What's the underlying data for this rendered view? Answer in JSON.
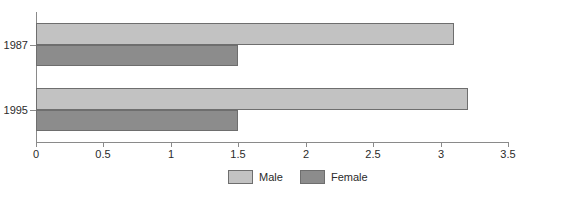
{
  "chart_data": {
    "type": "bar",
    "orientation": "horizontal",
    "title": "",
    "xlabel": "",
    "ylabel": "",
    "categories": [
      "1987",
      "1995"
    ],
    "series": [
      {
        "name": "Male",
        "color": "#c2c2c2",
        "values": [
          3.1,
          3.2
        ]
      },
      {
        "name": "Female",
        "color": "#8c8c8c",
        "values": [
          1.5,
          1.5
        ]
      }
    ],
    "xlim": [
      0,
      3.5
    ],
    "xticks": [
      0,
      0.5,
      1,
      1.5,
      2,
      2.5,
      3,
      3.5
    ],
    "xtick_labels": [
      "0",
      "0.5",
      "1",
      "1.5",
      "2",
      "2.5",
      "3",
      "3.5"
    ],
    "grid": false,
    "legend_position": "bottom",
    "legend": [
      {
        "label": "Male",
        "color": "#c2c2c2"
      },
      {
        "label": "Female",
        "color": "#8c8c8c"
      }
    ]
  },
  "axis": {
    "y_labels": [
      "1987",
      "1995"
    ]
  }
}
